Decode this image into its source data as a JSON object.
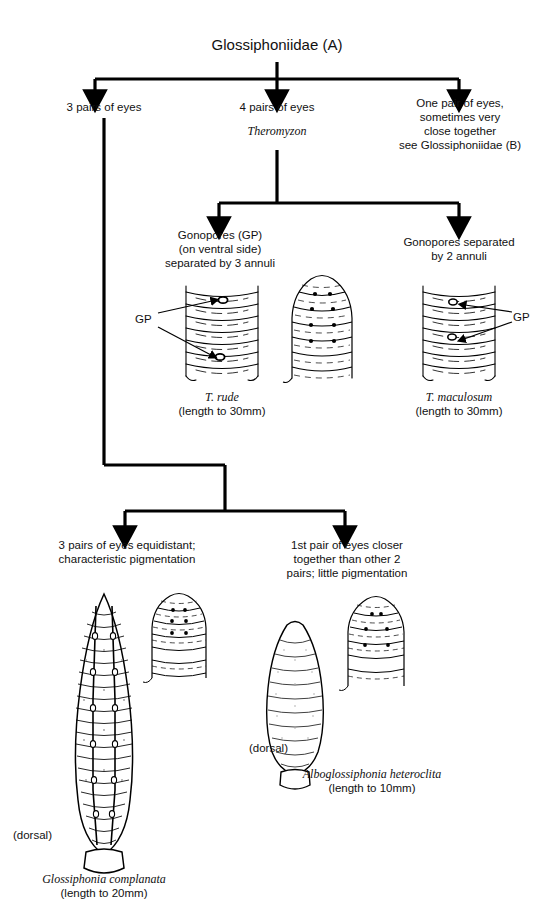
{
  "title": "Glossiphoniidae (A)",
  "branches": {
    "left": "3 pairs of eyes",
    "middle": "4 pairs of eyes",
    "middle_genus": "Theromyzon",
    "right": "One pair of eyes,\nsometimes very\nclose together\nsee Glossiphoniidae (B)"
  },
  "theromyzon": {
    "left_caption": "Gonopores (GP)\n(on ventral side)\nseparated by 3 annuli",
    "right_caption": "Gonopores separated\nby 2 annuli",
    "gp_label_left": "GP",
    "gp_label_right": "GP",
    "species_left": "T. rude",
    "species_left_length": "(length to 30mm)",
    "species_right": "T. maculosum",
    "species_right_length": "(length to 30mm)"
  },
  "glossiphonia_split": {
    "left_caption": "3 pairs of eyes equidistant;\ncharacteristic pigmentation",
    "right_caption": "1st pair of eyes closer\ntogether than other 2\npairs; little pigmentation"
  },
  "species_bottom": {
    "left_name": "Glossiphonia complanata",
    "left_length": "(length to 20mm)",
    "left_view": "(dorsal)",
    "right_name": "Alboglossiphonia heteroclita",
    "right_length": "(length to 10mm)",
    "right_view": "(dorsal)"
  },
  "colors": {
    "ink": "#000000",
    "page": "#ffffff",
    "line": "#111111"
  }
}
